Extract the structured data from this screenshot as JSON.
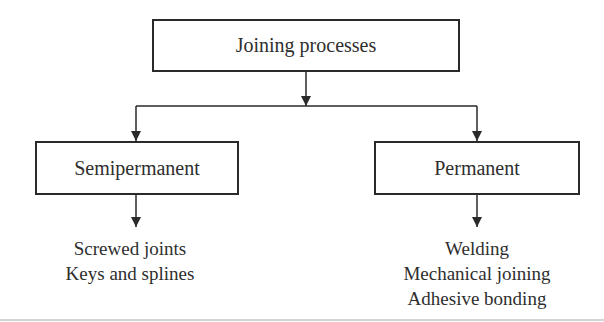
{
  "diagram": {
    "type": "hierarchy",
    "root": {
      "label": "Joining processes"
    },
    "categories": [
      {
        "label": "Semipermanent",
        "items": [
          "Screwed joints",
          "Keys and splines"
        ]
      },
      {
        "label": "Permanent",
        "items": [
          "Welding",
          "Mechanical joining",
          "Adhesive bonding"
        ]
      }
    ],
    "colors": {
      "line": "#2a2a2a",
      "text": "#2e2e2e",
      "background": "#ffffff"
    }
  }
}
